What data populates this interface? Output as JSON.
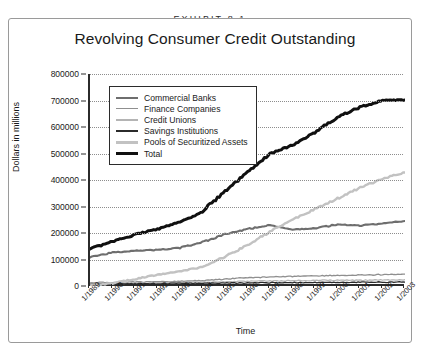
{
  "exhibit": {
    "label": "EXHIBIT 8.1"
  },
  "chart_data": {
    "type": "line",
    "title": "Revolving Consumer Credit Outstanding",
    "xlabel": "Time",
    "ylabel": "Dollars in millions",
    "ylim": [
      0,
      800000
    ],
    "ytick_labels": [
      "800000",
      "700000",
      "600000",
      "500000",
      "400000",
      "300000",
      "200000",
      "100000",
      "0"
    ],
    "ytick_values": [
      800000,
      700000,
      600000,
      500000,
      400000,
      300000,
      200000,
      100000,
      0
    ],
    "grid": "horizontal-dotted",
    "legend_position": "upper-left-inside",
    "categories": [
      "1/1989",
      "1/1990",
      "1/1991",
      "1/1992",
      "1/1993",
      "1/1994",
      "1/1995",
      "1/1996",
      "1/1997",
      "1/1998",
      "1/1999",
      "1/2000",
      "1/2001",
      "1/2002",
      "1/2003"
    ],
    "x": [
      1989,
      1990,
      1991,
      1992,
      1993,
      1994,
      1995,
      1996,
      1997,
      1998,
      1999,
      2000,
      2001,
      2002,
      2003
    ],
    "series": [
      {
        "name": "Commercial Banks",
        "color": "#6e6e6e",
        "width": 2.1,
        "values": [
          110000,
          126000,
          134000,
          136000,
          144000,
          165000,
          195000,
          215000,
          230000,
          212000,
          218000,
          232000,
          228000,
          236000,
          245000
        ]
      },
      {
        "name": "Finance Companies",
        "color": "#8f8f8f",
        "width": 1.3,
        "values": [
          12000,
          14000,
          15000,
          16000,
          18000,
          21000,
          26000,
          31000,
          34000,
          36000,
          38000,
          40000,
          41000,
          43000,
          45000
        ]
      },
      {
        "name": "Credit Unions",
        "color": "#b4b4b4",
        "width": 1.2,
        "values": [
          9000,
          10000,
          11000,
          12000,
          13000,
          14000,
          16000,
          18000,
          19000,
          20000,
          21000,
          22000,
          22000,
          23000,
          24000
        ]
      },
      {
        "name": "Savings Institutions",
        "color": "#2b2b2b",
        "width": 1.3,
        "values": [
          7000,
          8000,
          8500,
          9000,
          9500,
          10000,
          11000,
          12000,
          12500,
          13000,
          13500,
          14000,
          14000,
          14500,
          15000
        ]
      },
      {
        "name": "Pools of Securitized Assets",
        "color": "#c2c2c2",
        "width": 2.4,
        "values": [
          2000,
          10000,
          26000,
          42000,
          56000,
          72000,
          110000,
          155000,
          205000,
          250000,
          290000,
          330000,
          370000,
          405000,
          428000
        ]
      },
      {
        "name": "Total",
        "color": "#101010",
        "width": 3.0,
        "values": [
          140000,
          168000,
          194000,
          215000,
          240000,
          282000,
          358000,
          431000,
          500000,
          531000,
          581000,
          638000,
          675000,
          700000,
          702000
        ]
      }
    ]
  }
}
